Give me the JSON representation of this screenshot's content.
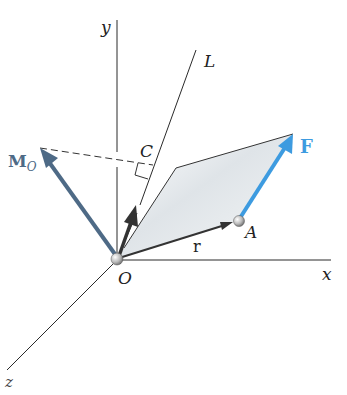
{
  "diagram": {
    "labels": {
      "y_axis": "y",
      "x_axis": "x",
      "z_axis": "z",
      "line_L": "L",
      "point_C": "C",
      "origin": "O",
      "point_A": "A",
      "position_vector": "r",
      "force": "F",
      "moment_main": "M",
      "moment_sub": "O"
    },
    "colors": {
      "axis": "#2a2a2a",
      "force": "#3d9be0",
      "moment": "#4e6a86",
      "projection": "#3a3a3a",
      "plane_fill": "#dfe3e6"
    }
  }
}
